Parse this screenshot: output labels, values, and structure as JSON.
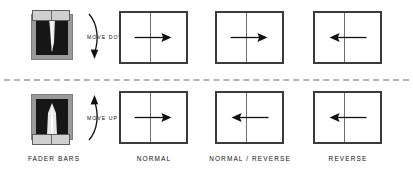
{
  "figure": {
    "line_color": "#3b3b3b",
    "divider_color": "#b5b5b5",
    "fader_body_color": "#9a9a9a",
    "fader_well_color": "#161616",
    "fader_cap_color": "#cfcfcf"
  },
  "captions": [
    {
      "name": "fader-bars",
      "label": "FADER BARS"
    },
    {
      "name": "normal",
      "label": "NORMAL"
    },
    {
      "name": "normal-reverse",
      "label": "NORMAL / REVERSE"
    },
    {
      "name": "reverse",
      "label": "REVERSE"
    }
  ],
  "rows": [
    {
      "id": "move-down",
      "move_label": "MOVE DOWN",
      "fader_position": "top",
      "boxes": [
        {
          "name": "normal",
          "arrow_direction": "right",
          "arrow_label": "right-arrow-icon"
        },
        {
          "name": "normal-reverse",
          "arrow_direction": "right",
          "arrow_label": "right-arrow-icon"
        },
        {
          "name": "reverse",
          "arrow_direction": "left",
          "arrow_label": "left-arrow-icon"
        }
      ]
    },
    {
      "id": "move-up",
      "move_label": "MOVE UP",
      "fader_position": "bottom",
      "boxes": [
        {
          "name": "normal",
          "arrow_direction": "right",
          "arrow_label": "right-arrow-icon"
        },
        {
          "name": "normal-reverse",
          "arrow_direction": "left",
          "arrow_label": "left-arrow-icon"
        },
        {
          "name": "reverse",
          "arrow_direction": "left",
          "arrow_label": "left-arrow-icon"
        }
      ]
    }
  ]
}
